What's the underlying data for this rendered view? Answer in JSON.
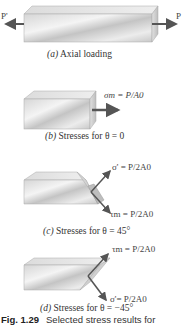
{
  "figure": {
    "number": "Fig. 1.29",
    "caption": "Selected stress results for",
    "panels": [
      {
        "id": "a",
        "caption_letter": "(a)",
        "caption_text": " Axial loading",
        "labels": {
          "left_force": "P'",
          "right_force": "P"
        }
      },
      {
        "id": "b",
        "caption_letter": "(b)",
        "caption_text": " Stresses for θ = 0",
        "labels": {
          "stress": "σm = P/A0"
        }
      },
      {
        "id": "c",
        "caption_letter": "(c)",
        "caption_text": " Stresses for θ = 45°",
        "labels": {
          "normal": "σ' = P/2A0",
          "shear": "τm = P/2A0"
        }
      },
      {
        "id": "d",
        "caption_letter": "(d)",
        "caption_text": " Stresses for θ = −45°",
        "labels": {
          "shear": "τm = P/2A0",
          "normal": "σ'= P/2A0"
        }
      }
    ]
  },
  "colors": {
    "arrow": "#555555",
    "text": "#333333",
    "block_light": "#f2f2f2",
    "block_dark": "#b8b8b8"
  }
}
